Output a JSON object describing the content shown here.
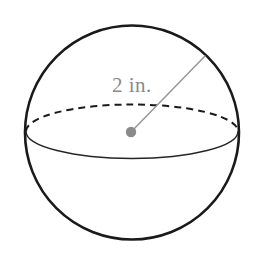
{
  "figure": {
    "name": "sphere-with-radius",
    "type": "geometry-diagram",
    "background_color": "#ffffff",
    "width": 256,
    "height": 257,
    "shape": {
      "name": "sphere",
      "outline_color": "#1a1a1a",
      "outline_width": 2.6,
      "fill_color": "#ffffff",
      "center_x": 132,
      "center_y": 132.5,
      "radius": 107
    },
    "equator": {
      "name": "equator-ellipse",
      "center_x": 132,
      "center_y": 131.5,
      "radius_x": 106,
      "radius_y": 27,
      "front_color": "#262626",
      "front_width": 1.5,
      "back_color": "#1a1a1a",
      "back_width": 2.0,
      "back_dash_pattern": "7 5"
    },
    "center_point": {
      "name": "center-dot",
      "x": 131,
      "y": 132,
      "radius": 5.2,
      "color": "#8a8a8a"
    },
    "radius_line": {
      "name": "radius-segment",
      "x1": 131,
      "y1": 132,
      "x2": 205,
      "y2": 56,
      "color": "#9a9a9a",
      "width": 1.6
    },
    "label": {
      "name": "radius-measure-label",
      "text": "2 in.",
      "value": 2,
      "unit": "in.",
      "color": "#8a8a8a",
      "font_size": 21,
      "x": 112,
      "y": 74
    }
  }
}
